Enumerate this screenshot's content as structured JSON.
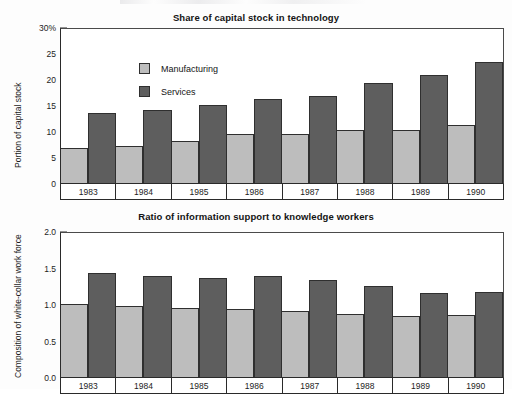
{
  "page": {
    "background": "#fdfdfd",
    "colors": {
      "manufacturing": "#bdbdbd",
      "services": "#5e5e5e",
      "axis": "#2a2a2a",
      "text": "#1a1a1a"
    }
  },
  "legend": {
    "manufacturing_label": "Manufacturing",
    "services_label": "Services"
  },
  "charts": [
    {
      "id": "share-of-capital-stock",
      "title": "Share of capital stock in technology",
      "ylabel": "Portion of capital stock",
      "ytick_labels": [
        "30%",
        "25",
        "20",
        "15",
        "10",
        "5",
        "0"
      ]
    },
    {
      "id": "ratio-information-support",
      "title": "Ratio of information support to knowledge workers",
      "ylabel": "Composition of white-collar work force",
      "ytick_labels": [
        "2.0",
        "1.5",
        "1.0",
        "0.5",
        "0.0"
      ]
    }
  ],
  "chart_data": [
    {
      "type": "bar",
      "title": "Share of capital stock in technology",
      "xlabel": "",
      "ylabel": "Portion of capital stock",
      "ylim": [
        0,
        30
      ],
      "yticks": [
        0,
        5,
        10,
        15,
        20,
        25,
        30
      ],
      "ytick_labels": [
        "0",
        "5",
        "10",
        "15",
        "20",
        "25",
        "30%"
      ],
      "grid": false,
      "legend_position": "inside-top-left",
      "categories": [
        "1983",
        "1984",
        "1985",
        "1986",
        "1987",
        "1988",
        "1989",
        "1990"
      ],
      "series": [
        {
          "name": "Manufacturing",
          "color": "#bdbdbd",
          "values": [
            6.8,
            7.2,
            8.1,
            9.5,
            9.5,
            10.4,
            10.4,
            11.3
          ]
        },
        {
          "name": "Services",
          "color": "#5e5e5e",
          "values": [
            13.6,
            14.2,
            15.2,
            16.4,
            17.0,
            19.5,
            21.0,
            23.5
          ]
        }
      ]
    },
    {
      "type": "bar",
      "title": "Ratio of information support to knowledge workers",
      "xlabel": "",
      "ylabel": "Composition of white-collar work force",
      "ylim": [
        0.0,
        2.0
      ],
      "yticks": [
        0.0,
        0.5,
        1.0,
        1.5,
        2.0
      ],
      "ytick_labels": [
        "0.0",
        "0.5",
        "1.0",
        "1.5",
        "2.0"
      ],
      "grid": false,
      "legend_position": "none",
      "categories": [
        "1983",
        "1984",
        "1985",
        "1986",
        "1987",
        "1988",
        "1989",
        "1990"
      ],
      "series": [
        {
          "name": "Manufacturing",
          "color": "#bdbdbd",
          "values": [
            1.01,
            0.99,
            0.96,
            0.95,
            0.91,
            0.88,
            0.85,
            0.86
          ]
        },
        {
          "name": "Services",
          "color": "#5e5e5e",
          "values": [
            1.44,
            1.4,
            1.38,
            1.4,
            1.35,
            1.27,
            1.17,
            1.18
          ]
        }
      ]
    }
  ]
}
